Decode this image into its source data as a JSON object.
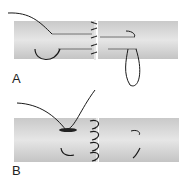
{
  "panels": [
    {
      "label": "A",
      "description": "Tendon repair with core suture and loop"
    },
    {
      "label": "B",
      "description": "Tendon repair with buried suture"
    }
  ],
  "colors": {
    "tendon": "#d6d6d6",
    "tendon_edge": "#bdbdbd",
    "suture": "#1a1a1a"
  }
}
